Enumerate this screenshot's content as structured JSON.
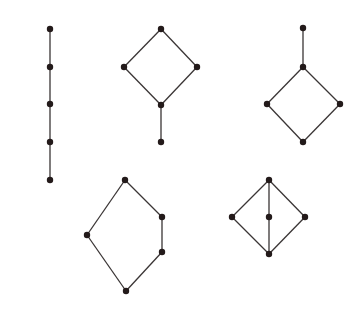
{
  "colors": {
    "edge": "#3a3535",
    "node": "#231a1a",
    "background": "#ffffff"
  },
  "node_radius": 3.2,
  "diagrams": [
    {
      "name": "chain-5",
      "nodes": [
        [
          50,
          29
        ],
        [
          50,
          67
        ],
        [
          50,
          104
        ],
        [
          50,
          142
        ],
        [
          50,
          180
        ]
      ],
      "edges": [
        [
          0,
          1
        ],
        [
          1,
          2
        ],
        [
          2,
          3
        ],
        [
          3,
          4
        ]
      ]
    },
    {
      "name": "diamond-with-bottom-tail",
      "nodes": [
        [
          161,
          29
        ],
        [
          124,
          67
        ],
        [
          197,
          67
        ],
        [
          161,
          105
        ],
        [
          161,
          142
        ]
      ],
      "edges": [
        [
          0,
          1
        ],
        [
          0,
          2
        ],
        [
          1,
          3
        ],
        [
          2,
          3
        ],
        [
          3,
          4
        ]
      ]
    },
    {
      "name": "diamond-with-top-tail",
      "nodes": [
        [
          303,
          28
        ],
        [
          303,
          67
        ],
        [
          267,
          104
        ],
        [
          340,
          104
        ],
        [
          303,
          142
        ]
      ],
      "edges": [
        [
          0,
          1
        ],
        [
          1,
          2
        ],
        [
          1,
          3
        ],
        [
          2,
          4
        ],
        [
          3,
          4
        ]
      ]
    },
    {
      "name": "pentagon-N5",
      "nodes": [
        [
          125,
          180
        ],
        [
          162,
          217
        ],
        [
          87,
          235
        ],
        [
          162,
          252
        ],
        [
          126,
          291
        ]
      ],
      "edges": [
        [
          0,
          1
        ],
        [
          1,
          3
        ],
        [
          3,
          4
        ],
        [
          0,
          2
        ],
        [
          2,
          4
        ]
      ]
    },
    {
      "name": "diamond-M3",
      "nodes": [
        [
          269,
          180
        ],
        [
          232,
          217
        ],
        [
          269,
          217
        ],
        [
          305,
          217
        ],
        [
          269,
          254
        ]
      ],
      "edges": [
        [
          0,
          1
        ],
        [
          0,
          2
        ],
        [
          0,
          3
        ],
        [
          1,
          4
        ],
        [
          2,
          4
        ],
        [
          3,
          4
        ]
      ]
    }
  ]
}
